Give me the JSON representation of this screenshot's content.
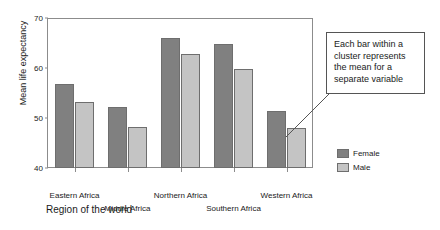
{
  "chart_data": {
    "type": "bar",
    "title": "",
    "subtitle": "",
    "xlabel": "Region of the world",
    "ylabel": "Mean life expectancy",
    "categories": [
      "Eastern Africa",
      "Middle Africa",
      "Northern Africa",
      "Southern Africa",
      "Western Africa"
    ],
    "series": [
      {
        "name": "Female",
        "color": "#808080",
        "values": [
          56.8,
          52.2,
          66.0,
          64.8,
          51.5
        ]
      },
      {
        "name": "Male",
        "color": "#c4c4c4",
        "values": [
          53.2,
          48.2,
          62.8,
          59.8,
          48.0
        ]
      }
    ],
    "ylim": [
      40,
      70
    ],
    "yticks": [
      40,
      50,
      60,
      70
    ],
    "ytick_labels": [
      "40",
      "50",
      "60",
      "70"
    ],
    "grid": false,
    "legend_position": "right"
  },
  "axis": {
    "y_title": "Mean life expectancy",
    "x_title": "Region of the world"
  },
  "legend": {
    "entries": [
      {
        "label": "Female",
        "color": "#808080"
      },
      {
        "label": "Male",
        "color": "#c4c4c4"
      }
    ]
  },
  "callout": {
    "text": "Each bar within a cluster represents the mean for a separate variable"
  }
}
